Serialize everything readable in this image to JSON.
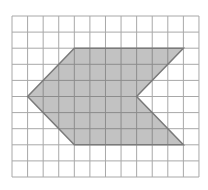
{
  "figure": {
    "grid": {
      "origin_px": [
        12,
        16
      ],
      "cell_w_px": 15.58,
      "cell_h_px": 16.1,
      "columns": 12,
      "rows": 10,
      "line_color": "#a8a8a8"
    },
    "shape": {
      "name": "chevron-arrow-polygon",
      "vertices_grid": [
        [
          4,
          2
        ],
        [
          11,
          2
        ],
        [
          8,
          5
        ],
        [
          11,
          8
        ],
        [
          4,
          8
        ],
        [
          1,
          5
        ]
      ],
      "fill_color": "#c2c2c2",
      "stroke_color": "#7a7a7a",
      "interior_grid_color": "#8c8c8c"
    }
  }
}
